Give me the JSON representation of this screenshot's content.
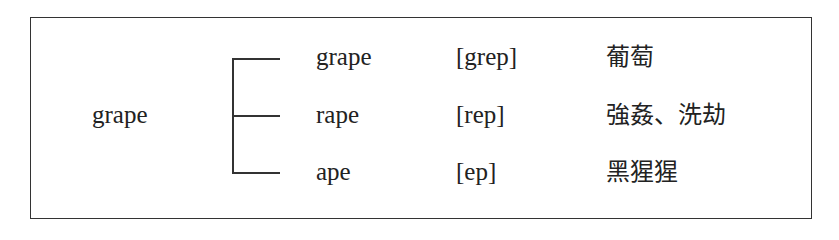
{
  "root_word": "grape",
  "rows": [
    {
      "word": "grape",
      "phonetic": "[grep]",
      "meaning": "葡萄"
    },
    {
      "word": "rape",
      "phonetic": "[rep]",
      "meaning": "強姦、洗劫"
    },
    {
      "word": "ape",
      "phonetic": "[ep]",
      "meaning": "黑猩猩"
    }
  ]
}
